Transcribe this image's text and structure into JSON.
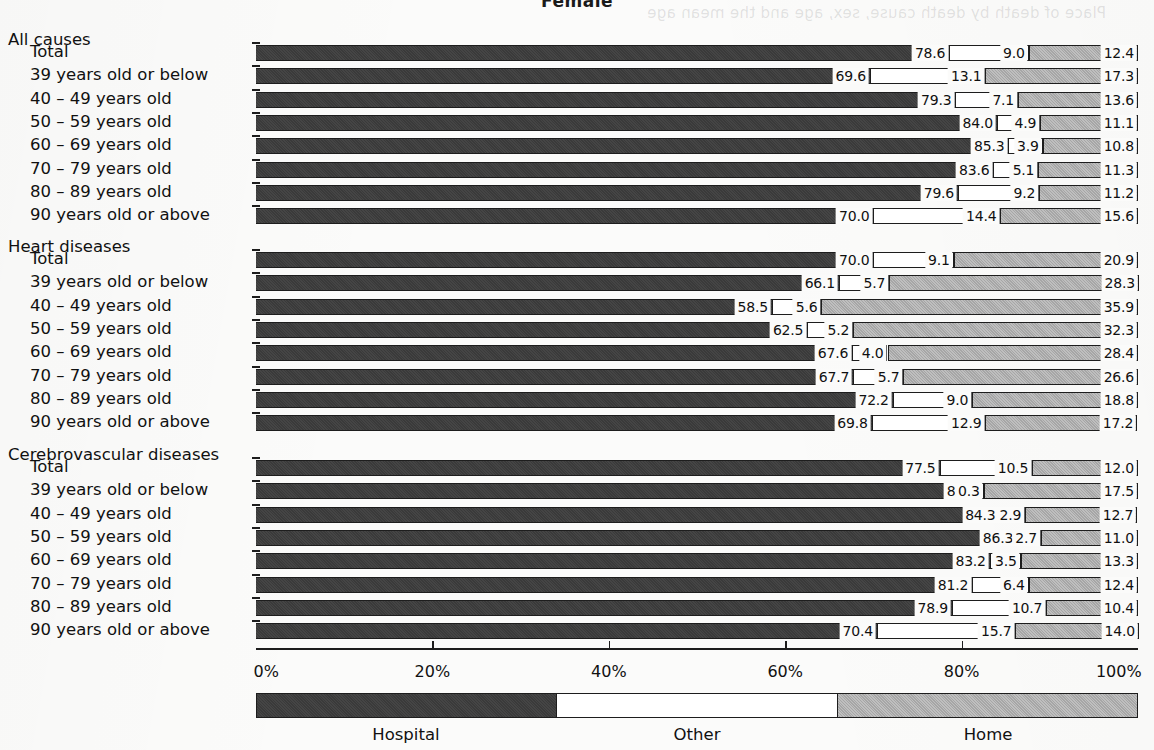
{
  "title": "Female",
  "bleed_text": "Place of death by death cause, sex, age and the mean age",
  "chart_data": {
    "type": "bar",
    "orientation": "horizontal",
    "stacked": true,
    "stack_total": 100,
    "title": "Female",
    "xlabel": "",
    "ylabel": "",
    "xlim": [
      0,
      100
    ],
    "grid": false,
    "legend_position": "bottom",
    "series": [
      {
        "name": "Hospital",
        "color": "#3a3a3a"
      },
      {
        "name": "Other",
        "color": "#ffffff"
      },
      {
        "name": "Home",
        "color": "#a6a6a6"
      }
    ],
    "x_ticks": [
      0,
      20,
      40,
      60,
      80,
      100
    ],
    "x_tick_labels": [
      "0%",
      "20%",
      "40%",
      "60%",
      "80%",
      "100%"
    ],
    "groups": [
      {
        "name": "All causes",
        "categories": [
          "Total",
          "39 years old or below",
          "40 – 49 years old",
          "50 – 59 years old",
          "60 – 69 years old",
          "70 – 79 years old",
          "80 – 89 years old",
          "90 years old or above"
        ],
        "hospital": [
          78.6,
          69.6,
          79.3,
          84.0,
          85.3,
          83.6,
          79.6,
          70.0
        ],
        "other": [
          9.0,
          13.1,
          7.1,
          4.9,
          3.9,
          5.1,
          9.2,
          14.4
        ],
        "home": [
          12.4,
          17.3,
          13.6,
          11.1,
          10.8,
          11.3,
          11.2,
          15.6
        ]
      },
      {
        "name": "Heart diseases",
        "categories": [
          "Total",
          "39 years old or below",
          "40 – 49 years old",
          "50 – 59 years old",
          "60 – 69 years old",
          "70 – 79 years old",
          "80 – 89 years old",
          "90 years old or above"
        ],
        "hospital": [
          70.0,
          66.1,
          58.5,
          62.5,
          67.6,
          67.7,
          72.2,
          69.8
        ],
        "other": [
          9.1,
          5.7,
          5.6,
          5.2,
          4.0,
          5.7,
          9.0,
          12.9
        ],
        "home": [
          20.9,
          28.3,
          35.9,
          32.3,
          28.4,
          26.6,
          18.8,
          17.2
        ]
      },
      {
        "name": "Cerebrovascular diseases",
        "categories": [
          "Total",
          "39 years old or below",
          "40 – 49 years old",
          "50 – 59 years old",
          "60 – 69 years old",
          "70 – 79 years old",
          "80 – 89 years old",
          "90 years old or above"
        ],
        "hospital": [
          77.5,
          82.2,
          84.3,
          86.3,
          83.2,
          81.2,
          78.9,
          70.4
        ],
        "other": [
          10.5,
          0.3,
          2.9,
          2.7,
          3.5,
          6.4,
          10.7,
          15.7
        ],
        "home": [
          12.0,
          17.5,
          12.7,
          11.0,
          13.3,
          12.4,
          10.4,
          14.0
        ]
      }
    ]
  },
  "legend": {
    "items": [
      {
        "label": "Hospital",
        "color": "#3a3a3a"
      },
      {
        "label": "Other",
        "color": "#ffffff"
      },
      {
        "label": "Home",
        "color": "#a6a6a6"
      }
    ]
  }
}
